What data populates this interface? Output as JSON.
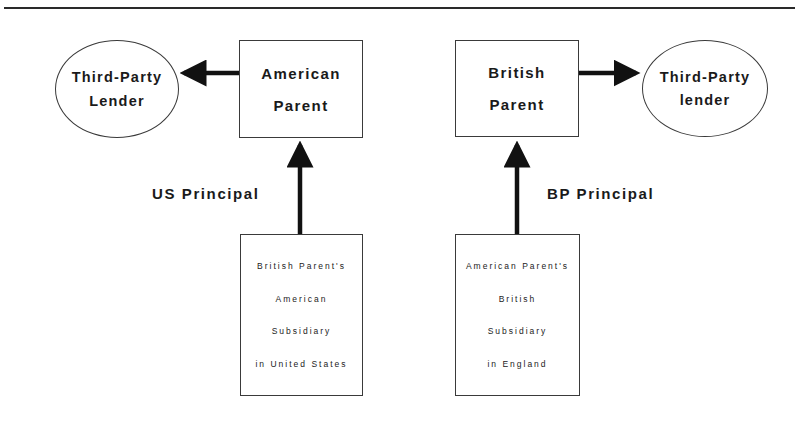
{
  "diagram": {
    "type": "flow",
    "colors": {
      "stroke": "#3a3a3a",
      "arrow": "#111111",
      "text": "#1a1a1a",
      "background": "#ffffff"
    },
    "nodes": {
      "left_lender": {
        "shape": "ellipse",
        "lines": [
          "Third-Party",
          "Lender"
        ]
      },
      "american_parent": {
        "shape": "box",
        "lines": [
          "American",
          "Parent"
        ]
      },
      "british_parent": {
        "shape": "box",
        "lines": [
          "British",
          "Parent"
        ]
      },
      "right_lender": {
        "shape": "ellipse",
        "lines": [
          "Third-Party",
          "lender"
        ]
      },
      "us_subsidiary": {
        "shape": "box",
        "lines": [
          "British Parent's",
          "American",
          "Subsidiary",
          "in United States"
        ]
      },
      "uk_subsidiary": {
        "shape": "box",
        "lines": [
          "American Parent's",
          "British",
          "Subsidiary",
          "in England"
        ]
      }
    },
    "edge_labels": {
      "us_principal": "US Principal",
      "bp_principal": "BP Principal"
    },
    "edges": [
      {
        "from": "american_parent",
        "to": "left_lender"
      },
      {
        "from": "british_parent",
        "to": "right_lender"
      },
      {
        "from": "us_subsidiary",
        "to": "american_parent",
        "label": "US Principal"
      },
      {
        "from": "uk_subsidiary",
        "to": "british_parent",
        "label": "BP Principal"
      }
    ]
  }
}
